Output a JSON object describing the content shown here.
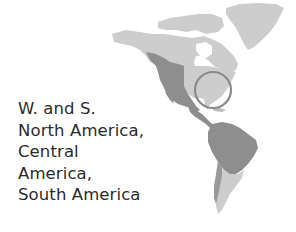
{
  "caption": {
    "lines": [
      "W. and S.",
      "North America,",
      "Central",
      "America,",
      "South America"
    ]
  },
  "map": {
    "region": "Americas",
    "highlighted_range": "W. and S. North America, Central America, South America",
    "marker": "circle around eastern United States",
    "colors": {
      "land": "#cdcdcd",
      "range": "#8e8e8e",
      "marker": "#8a8a8a",
      "background": "#ffffff"
    }
  }
}
